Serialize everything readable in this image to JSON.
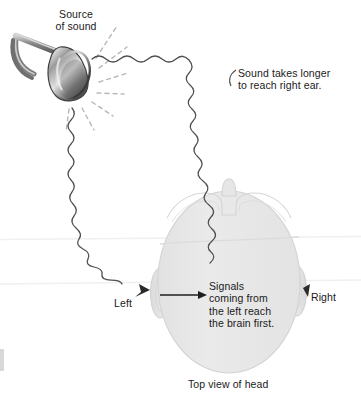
{
  "figure": {
    "caption": "Top view of head",
    "labels": {
      "source": "Source\nof sound",
      "delay": "Sound takes longer\nto reach right ear.",
      "signals": "Signals\ncoming from\nthe left reach\nthe brain first.",
      "left_ear": "Left",
      "right_ear": "Right"
    },
    "colors": {
      "text": "#1a1a1a",
      "head_fill": "#e7e7e7",
      "head_stroke": "#d2d2d2",
      "ear_fill": "#dedede",
      "wave_stroke": "#4a4a4a",
      "ray_stroke": "#b4b4b4",
      "horn_dark": "#4a4a4a",
      "horn_light": "#e0e0e0",
      "scan_line": "#efefef",
      "background": "#ffffff"
    },
    "icons": {
      "sound_source": "horn-icon",
      "head": "head-top-view-icon",
      "left_ear": "ear-icon",
      "right_ear": "ear-icon",
      "left_wave": "sound-wave-icon",
      "right_wave": "sound-wave-icon",
      "signal_arrow": "arrow-right-icon"
    }
  }
}
